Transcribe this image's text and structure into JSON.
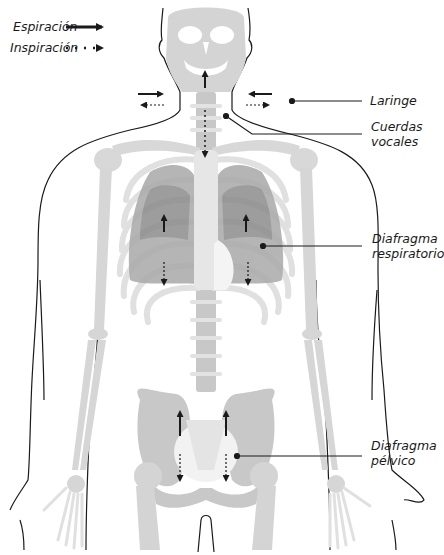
{
  "legend": {
    "expiration": {
      "label": "Espiración",
      "style": "solid-arrow"
    },
    "inspiration": {
      "label": "Inspiración",
      "style": "dotted-arrow"
    }
  },
  "labels": {
    "larynx": {
      "text": "Laringe"
    },
    "vocal_cords": {
      "line1": "Cuerdas",
      "line2": "vocales"
    },
    "respiratory_diaphragm": {
      "line1": "Diafragma",
      "line2": "respiratorio"
    },
    "pelvic_diaphragm": {
      "line1": "Diafragma",
      "line2": "pélvico"
    }
  },
  "colors": {
    "bone": "#d4d4d4",
    "bone_light": "#e6e6e6",
    "lung": "#a9a9a9",
    "lung_dark": "#8c8c8c",
    "outline": "#1a1a1a",
    "background": "#ffffff"
  }
}
